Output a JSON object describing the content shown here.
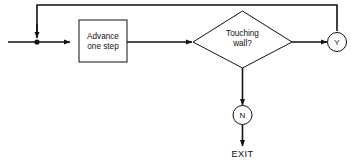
{
  "diagram": {
    "background_color": "#ffffff",
    "line_color": "#111111",
    "nodes": {
      "process": {
        "label_line1": "Advance",
        "label_line2": "one step",
        "shape": "rectangle"
      },
      "decision": {
        "label_line1": "Touching",
        "label_line2": "wall?",
        "shape": "diamond"
      },
      "yes_badge": {
        "label": "Y",
        "shape": "circle"
      },
      "no_badge": {
        "label": "N",
        "shape": "circle"
      },
      "exit": {
        "label": "EXIT",
        "shape": "text"
      }
    },
    "icons": {
      "arrow_into_process": "arrow-right-icon",
      "arrow_into_decision": "arrow-right-icon",
      "arrow_into_yes": "arrow-right-icon",
      "arrow_into_no": "arrow-down-icon",
      "arrow_into_exit": "arrow-down-icon",
      "arrow_loop_down": "arrow-down-icon",
      "junction": "junction-dot-icon"
    }
  }
}
